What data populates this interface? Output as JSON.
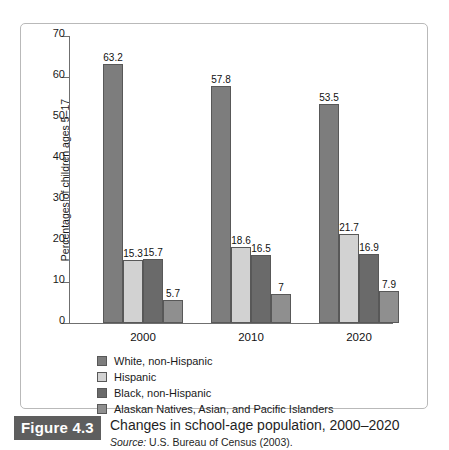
{
  "chart_data": {
    "type": "bar",
    "title": "",
    "xlabel": "",
    "ylabel": "Percentages of children ages 5–17",
    "ylim": [
      0,
      70
    ],
    "yticks": [
      "0",
      "10",
      "20",
      "30",
      "40",
      "50",
      "60",
      "70"
    ],
    "grid": false,
    "legend_position": "below-plot",
    "categories": [
      "2000",
      "2010",
      "2020"
    ],
    "series": [
      {
        "name": "White, non-Hispanic",
        "color": "#7d7d7d",
        "values": [
          63.2,
          57.8,
          53.5
        ],
        "labels": [
          "63.2",
          "57.8",
          "53.5"
        ]
      },
      {
        "name": "Hispanic",
        "color": "#d2d2d2",
        "values": [
          15.3,
          18.6,
          21.7
        ],
        "labels": [
          "15.3",
          "18.6",
          "21.7"
        ]
      },
      {
        "name": "Black, non-Hispanic",
        "color": "#6a6a6a",
        "values": [
          15.7,
          16.5,
          16.9
        ],
        "labels": [
          "15.7",
          "16.5",
          "16.9"
        ]
      },
      {
        "name": "Alaskan Natives, Asian, and Pacific Islanders",
        "color": "#8f8f8f",
        "values": [
          5.7,
          7.0,
          7.9
        ],
        "labels": [
          "5.7",
          "7",
          "7.9"
        ]
      }
    ]
  },
  "caption": {
    "figure_label": "Figure 4.3",
    "title": "Changes in school-age population, 2000–2020",
    "source_prefix": "Source:",
    "source_text": " U.S. Bureau of Census (2003)."
  },
  "colors": {
    "frame_border": "#b9b9b9",
    "axis": "#6f6f6f",
    "bar_outline": "#585858",
    "badge_background": "#5e5e5e",
    "badge_text": "#ffffff",
    "text": "#1a1a1a"
  }
}
